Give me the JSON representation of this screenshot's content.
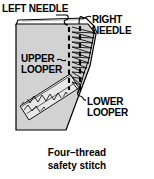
{
  "figure": {
    "caption": "Four–thread\nsafety stitch",
    "labels": {
      "left_needle": "LEFT NEEDLE",
      "right_needle": "RIGHT\nNEEDLE",
      "upper_looper": "UPPER\nLOOPER",
      "lower_looper": "LOWER\nLOOPER"
    },
    "colors": {
      "fabric_fill": "#d2d2d2",
      "fabric_flap_fill": "#ffffff",
      "outline": "#000000",
      "text": "#000000",
      "background": "#ffffff",
      "stitch": "#000000"
    },
    "parts": {
      "fabric": "fabric-piece",
      "fold_flap": "folded-edge-flap",
      "left_needle_stitch_line": "left-needle-thread-line",
      "right_needle_stitch_line": "right-needle-thread-line",
      "upper_looper_stitch": "upper-looper-overlock-loops",
      "lower_looper_stitch": "lower-looper-chain-band"
    }
  }
}
